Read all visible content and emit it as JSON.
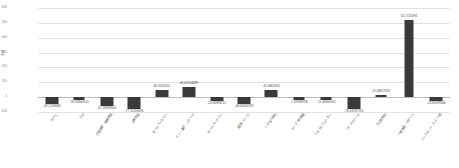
{
  "chart_data": {
    "type": "bar",
    "title": "",
    "xlabel": "",
    "ylabel": "金額",
    "ylim": [
      -100,
      600
    ],
    "yticks": [
      -100,
      0,
      100,
      200,
      300,
      400,
      500,
      600
    ],
    "ytick_labels": [
      "-100",
      "0",
      "100",
      "200",
      "300",
      "400",
      "500",
      "600"
    ],
    "grid": true,
    "legend": "none",
    "categories": [
      "きのこ",
      "たけ",
      "冷凍野菜・乾燥野菜",
      "冷凍食品",
      "ホームベーカリー",
      "パン・菓子・スナック",
      "ホームベーカリー",
      "健康ドリンク",
      "くだもの飲料",
      "スープ・即席麺",
      "ミネラルウォーター",
      "アイスクリーム",
      "その他飲料",
      "一般食品・デザート",
      "インスタントコーヒー類"
    ],
    "values": [
      -49.1748086,
      -18.09640615,
      -61.29349044,
      -77.12418591,
      48.3251634,
      66.62564899,
      -24.83983211,
      -48.69430709,
      45.5865305,
      -1.59338758,
      -11.08460131,
      -78.43197255,
      15.08627451,
      521.720394,
      -23.81699346
    ],
    "value_labels": [
      "-49.1748086",
      "-18.09640615",
      "-61.29349044",
      "-77.12418591",
      "48.3251634",
      "66.62564899",
      "-24.83983211",
      "-48.69430709",
      "45.5865305",
      "-1.59338758",
      "-11.08460131",
      "-78.43197255",
      "15.08627451",
      "521.720394",
      "-23.81699346"
    ],
    "bar_color": "#3a3a3a",
    "grid_color": "#e2e2e2"
  }
}
